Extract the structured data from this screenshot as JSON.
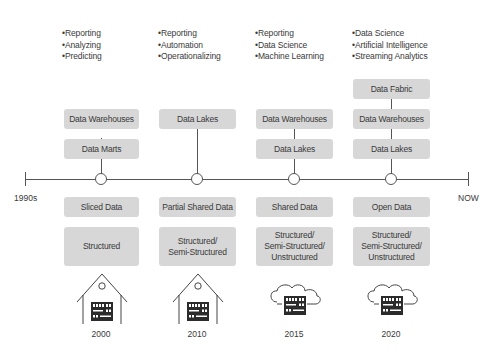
{
  "timeline": {
    "start_label": "1990s",
    "end_label": "NOW"
  },
  "eras": [
    {
      "year": "2000",
      "uses": [
        "Reporting",
        "Analyzing",
        "Predicting"
      ],
      "architectures": [
        "Data Warehouses",
        "Data Marts"
      ],
      "sharing": "Sliced Data",
      "data_types": "Structured",
      "infrastructure": "house-server-icon"
    },
    {
      "year": "2010",
      "uses": [
        "Reporting",
        "Automation",
        "Operationalizing"
      ],
      "architectures": [
        "Data Lakes"
      ],
      "sharing": "Partial Shared Data",
      "data_types": "Structured/\nSemi-Structured",
      "infrastructure": "house-server-icon"
    },
    {
      "year": "2015",
      "uses": [
        "Reporting",
        "Data Science",
        "Machine Learning"
      ],
      "architectures": [
        "Data Warehouses",
        "Data Lakes"
      ],
      "sharing": "Shared Data",
      "data_types": "Structured/\nSemi-Structured/\nUnstructured",
      "infrastructure": "cloud-server-icon"
    },
    {
      "year": "2020",
      "uses": [
        "Data Science",
        "Artificial Intelligence",
        "Streaming Analytics"
      ],
      "architectures": [
        "Data Fabric",
        "Data Warehouses",
        "Data Lakes"
      ],
      "sharing": "Open Data",
      "data_types": "Structured/\nSemi-Structured/\nUnstructured",
      "infrastructure": "cloud-server-icon"
    }
  ],
  "colors": {
    "box_fill": "#d7d7d7",
    "line": "#555555",
    "text": "#3a3a3a"
  }
}
